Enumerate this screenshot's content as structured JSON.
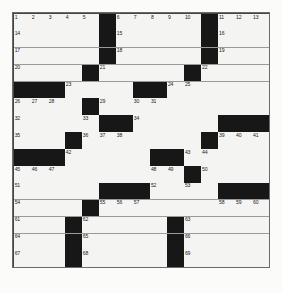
{
  "puzzle": {
    "title": "Crossword Grid",
    "size": 15,
    "rows": 15,
    "columns": 15,
    "colors": {
      "block": "#171717",
      "cell": "#f4f4f2",
      "grid_line": "#9a9a98",
      "number_text": "#1b1b1b",
      "page_background": "#fbfbfa"
    },
    "caption": "",
    "blocks": [
      [
        0,
        5
      ],
      [
        0,
        11
      ],
      [
        1,
        5
      ],
      [
        1,
        11
      ],
      [
        2,
        5
      ],
      [
        2,
        11
      ],
      [
        3,
        4
      ],
      [
        3,
        10
      ],
      [
        4,
        0
      ],
      [
        4,
        1
      ],
      [
        4,
        2
      ],
      [
        4,
        7
      ],
      [
        4,
        8
      ],
      [
        5,
        4
      ],
      [
        6,
        5
      ],
      [
        6,
        6
      ],
      [
        6,
        12
      ],
      [
        6,
        13
      ],
      [
        6,
        14
      ],
      [
        7,
        3
      ],
      [
        7,
        11
      ],
      [
        8,
        0
      ],
      [
        8,
        1
      ],
      [
        8,
        2
      ],
      [
        8,
        8
      ],
      [
        8,
        9
      ],
      [
        9,
        10
      ],
      [
        10,
        5
      ],
      [
        10,
        6
      ],
      [
        10,
        7
      ],
      [
        10,
        12
      ],
      [
        10,
        13
      ],
      [
        10,
        14
      ],
      [
        11,
        4
      ],
      [
        12,
        3
      ],
      [
        12,
        9
      ],
      [
        13,
        3
      ],
      [
        13,
        9
      ],
      [
        14,
        3
      ],
      [
        14,
        9
      ]
    ],
    "numbers": [
      {
        "row": 0,
        "col": 0,
        "n": "1"
      },
      {
        "row": 0,
        "col": 1,
        "n": "2"
      },
      {
        "row": 0,
        "col": 2,
        "n": "3"
      },
      {
        "row": 0,
        "col": 3,
        "n": "4"
      },
      {
        "row": 0,
        "col": 4,
        "n": "5"
      },
      {
        "row": 0,
        "col": 6,
        "n": "6"
      },
      {
        "row": 0,
        "col": 7,
        "n": "7"
      },
      {
        "row": 0,
        "col": 8,
        "n": "8"
      },
      {
        "row": 0,
        "col": 9,
        "n": "9"
      },
      {
        "row": 0,
        "col": 10,
        "n": "10"
      },
      {
        "row": 0,
        "col": 12,
        "n": "11"
      },
      {
        "row": 0,
        "col": 13,
        "n": "12"
      },
      {
        "row": 0,
        "col": 14,
        "n": "13"
      },
      {
        "row": 1,
        "col": 0,
        "n": "14"
      },
      {
        "row": 1,
        "col": 6,
        "n": "15"
      },
      {
        "row": 1,
        "col": 12,
        "n": "16"
      },
      {
        "row": 2,
        "col": 0,
        "n": "17"
      },
      {
        "row": 2,
        "col": 6,
        "n": "18"
      },
      {
        "row": 2,
        "col": 12,
        "n": "19"
      },
      {
        "row": 3,
        "col": 0,
        "n": "20"
      },
      {
        "row": 3,
        "col": 5,
        "n": "21"
      },
      {
        "row": 3,
        "col": 11,
        "n": "22"
      },
      {
        "row": 4,
        "col": 3,
        "n": "23"
      },
      {
        "row": 4,
        "col": 9,
        "n": "24"
      },
      {
        "row": 4,
        "col": 10,
        "n": "25"
      },
      {
        "row": 5,
        "col": 0,
        "n": "26"
      },
      {
        "row": 5,
        "col": 1,
        "n": "27"
      },
      {
        "row": 5,
        "col": 2,
        "n": "28"
      },
      {
        "row": 5,
        "col": 5,
        "n": "29"
      },
      {
        "row": 5,
        "col": 7,
        "n": "30"
      },
      {
        "row": 5,
        "col": 8,
        "n": "31"
      },
      {
        "row": 6,
        "col": 0,
        "n": "32"
      },
      {
        "row": 6,
        "col": 4,
        "n": "33"
      },
      {
        "row": 6,
        "col": 7,
        "n": "34"
      },
      {
        "row": 7,
        "col": 0,
        "n": "35"
      },
      {
        "row": 7,
        "col": 4,
        "n": "36"
      },
      {
        "row": 7,
        "col": 5,
        "n": "37"
      },
      {
        "row": 7,
        "col": 6,
        "n": "38"
      },
      {
        "row": 7,
        "col": 12,
        "n": "39"
      },
      {
        "row": 7,
        "col": 13,
        "n": "40"
      },
      {
        "row": 7,
        "col": 14,
        "n": "41"
      },
      {
        "row": 8,
        "col": 3,
        "n": "42"
      },
      {
        "row": 8,
        "col": 10,
        "n": "43"
      },
      {
        "row": 8,
        "col": 11,
        "n": "44"
      },
      {
        "row": 9,
        "col": 0,
        "n": "45"
      },
      {
        "row": 9,
        "col": 1,
        "n": "46"
      },
      {
        "row": 9,
        "col": 2,
        "n": "47"
      },
      {
        "row": 9,
        "col": 8,
        "n": "48"
      },
      {
        "row": 9,
        "col": 9,
        "n": "49"
      },
      {
        "row": 9,
        "col": 11,
        "n": "50"
      },
      {
        "row": 10,
        "col": 0,
        "n": "51"
      },
      {
        "row": 10,
        "col": 8,
        "n": "52"
      },
      {
        "row": 10,
        "col": 10,
        "n": "53"
      },
      {
        "row": 11,
        "col": 0,
        "n": "54"
      },
      {
        "row": 11,
        "col": 5,
        "n": "55"
      },
      {
        "row": 11,
        "col": 6,
        "n": "56"
      },
      {
        "row": 11,
        "col": 7,
        "n": "57"
      },
      {
        "row": 11,
        "col": 12,
        "n": "58"
      },
      {
        "row": 11,
        "col": 13,
        "n": "59"
      },
      {
        "row": 11,
        "col": 14,
        "n": "60"
      },
      {
        "row": 12,
        "col": 0,
        "n": "61"
      },
      {
        "row": 12,
        "col": 4,
        "n": "62"
      },
      {
        "row": 12,
        "col": 10,
        "n": "63"
      },
      {
        "row": 13,
        "col": 0,
        "n": "64"
      },
      {
        "row": 13,
        "col": 4,
        "n": "65"
      },
      {
        "row": 13,
        "col": 10,
        "n": "66"
      },
      {
        "row": 14,
        "col": 0,
        "n": "67"
      },
      {
        "row": 14,
        "col": 4,
        "n": "68"
      },
      {
        "row": 14,
        "col": 10,
        "n": "69"
      }
    ]
  }
}
